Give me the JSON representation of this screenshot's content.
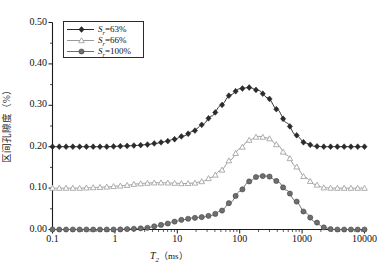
{
  "chart_data": {
    "type": "line",
    "title": "",
    "xlabel": "T2 (ms)",
    "ylabel": "区间孔隙度（%）",
    "xscale": "log",
    "xlim": [
      0.1,
      10000
    ],
    "ylim": [
      0.0,
      0.5
    ],
    "ytick_labels": [
      "0.00",
      "0.10",
      "0.20",
      "0.30",
      "0.40",
      "0.50"
    ],
    "ytick_values": [
      0.0,
      0.1,
      0.2,
      0.3,
      0.4,
      0.5
    ],
    "xtick_labels": [
      "0.1",
      "1",
      "10",
      "100",
      "1000",
      "10000"
    ],
    "xtick_values": [
      0.1,
      1,
      10,
      100,
      1000,
      10000
    ],
    "grid": false,
    "legend_position": "upper-left",
    "series": [
      {
        "name": "Sr=63%",
        "label_base": "S",
        "label_sub": "r",
        "label_value": "=63%",
        "marker": "diamond",
        "color": "#2b2b2b",
        "x": [
          0.1,
          0.14,
          0.2,
          0.28,
          0.4,
          0.56,
          0.79,
          1.1,
          1.6,
          2.2,
          3.2,
          4.5,
          6.3,
          8.9,
          12.6,
          17.8,
          25.1,
          35.5,
          50.1,
          70.8,
          100,
          141,
          200,
          282,
          398,
          562,
          794,
          1122,
          1585,
          2239,
          3162,
          4467,
          6310,
          10000
        ],
        "y": [
          0.2,
          0.2,
          0.2,
          0.2,
          0.2,
          0.2,
          0.2,
          0.201,
          0.202,
          0.203,
          0.205,
          0.208,
          0.212,
          0.218,
          0.226,
          0.237,
          0.253,
          0.274,
          0.3,
          0.325,
          0.34,
          0.343,
          0.336,
          0.318,
          0.29,
          0.258,
          0.228,
          0.209,
          0.201,
          0.2,
          0.2,
          0.2,
          0.2,
          0.2
        ]
      },
      {
        "name": "Sr=66%",
        "label_base": "S",
        "label_sub": "r",
        "label_value": "=66%",
        "marker": "triangle",
        "color": "#9a9a9a",
        "x": [
          0.1,
          0.14,
          0.2,
          0.28,
          0.4,
          0.56,
          0.79,
          1.1,
          1.6,
          2.2,
          3.2,
          4.5,
          6.3,
          8.9,
          12.6,
          17.8,
          25.1,
          35.5,
          50.1,
          70.8,
          100,
          141,
          200,
          282,
          398,
          562,
          794,
          1122,
          1585,
          2239,
          3162,
          4467,
          6310,
          10000
        ],
        "y": [
          0.1,
          0.1,
          0.1,
          0.1,
          0.101,
          0.102,
          0.103,
          0.105,
          0.107,
          0.11,
          0.112,
          0.113,
          0.113,
          0.112,
          0.111,
          0.112,
          0.116,
          0.126,
          0.143,
          0.168,
          0.195,
          0.216,
          0.225,
          0.221,
          0.205,
          0.18,
          0.152,
          0.126,
          0.109,
          0.101,
          0.1,
          0.1,
          0.1,
          0.1
        ]
      },
      {
        "name": "Sr=100%",
        "label_base": "S",
        "label_sub": "r",
        "label_value": "=100%",
        "marker": "circle",
        "color": "#6e6e6e",
        "x": [
          0.1,
          0.14,
          0.2,
          0.28,
          0.4,
          0.56,
          0.79,
          1.1,
          1.6,
          2.2,
          3.2,
          4.5,
          6.3,
          8.9,
          12.6,
          17.8,
          25.1,
          35.5,
          50.1,
          70.8,
          100,
          141,
          200,
          282,
          398,
          562,
          794,
          1122,
          1585,
          2239,
          3162,
          4467,
          6310,
          10000
        ],
        "y": [
          0.0,
          0.0,
          0.0,
          0.0,
          0.0,
          0.0,
          0.0,
          0.0,
          0.001,
          0.002,
          0.004,
          0.008,
          0.013,
          0.019,
          0.024,
          0.028,
          0.03,
          0.034,
          0.045,
          0.065,
          0.092,
          0.116,
          0.129,
          0.129,
          0.117,
          0.095,
          0.068,
          0.041,
          0.019,
          0.005,
          0.0,
          0.0,
          0.0,
          0.0
        ]
      }
    ]
  },
  "axes": {
    "ylabel": "区间孔隙度（%）",
    "xlabel_base": "T",
    "xlabel_sub": "2",
    "xlabel_unit": "（ms）"
  }
}
